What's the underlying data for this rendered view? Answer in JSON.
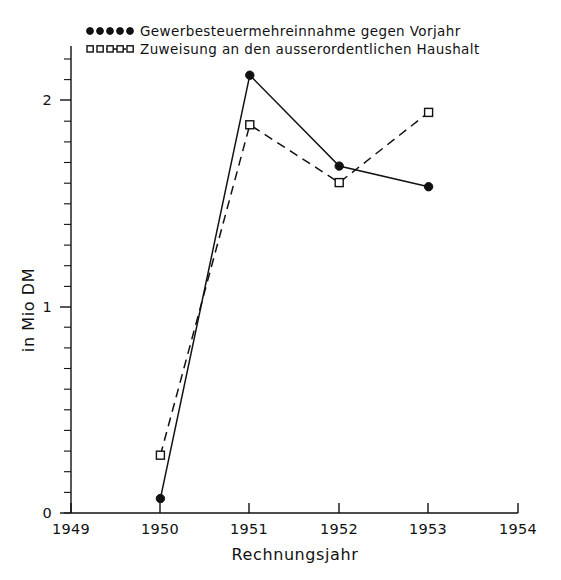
{
  "chart_data": {
    "type": "line",
    "title": "",
    "xlabel": "Rechnungsjahr",
    "ylabel": "in Mio DM",
    "x": [
      1950,
      1951,
      1952,
      1953
    ],
    "xlim": [
      1949,
      1954
    ],
    "ylim": [
      0,
      2.2
    ],
    "xticks": [
      "1949",
      "1950",
      "1951",
      "1952",
      "1953",
      "1954"
    ],
    "yticks": [
      "0",
      "1",
      "2"
    ],
    "grid": false,
    "legend_position": "top-left",
    "series": [
      {
        "name": "Gewerbesteuermehreinnahme gegen Vorjahr",
        "marker": "filled-circle",
        "line_style": "solid",
        "values": [
          0.07,
          2.12,
          1.68,
          1.58
        ]
      },
      {
        "name": "Zuweisung an den ausserordentlichen Haushalt",
        "marker": "open-square",
        "line_style": "dashed",
        "values": [
          0.28,
          1.88,
          1.6,
          1.94
        ]
      }
    ]
  },
  "legend": {
    "entries": [
      {
        "label": "Gewerbesteuermehreinnahme  gegen  Vorjahr",
        "marker": "filled-circle-row"
      },
      {
        "label": "Zuweisung  an  den  ausserordentlichen  Haushalt",
        "marker": "open-square-row"
      }
    ]
  },
  "axes": {
    "y_title": "in Mio DM",
    "x_title": "Rechnungsjahr",
    "y_tick_labels": [
      "2",
      "1",
      "0"
    ],
    "x_tick_labels": [
      "1949",
      "1950",
      "1951",
      "1952",
      "1953",
      "1954"
    ]
  },
  "colors": {
    "ink": "#111111",
    "background": "#ffffff"
  }
}
